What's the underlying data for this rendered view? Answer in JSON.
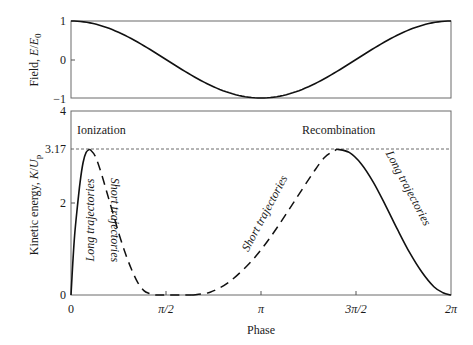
{
  "chart_data": [
    {
      "type": "line",
      "panel": "top",
      "title": "",
      "xlabel": "",
      "ylabel": "Field, E/E0",
      "ylabel_parts": {
        "main": "Field, ",
        "sym": "E",
        "slash": "/",
        "sym2": "E",
        "sub": "0"
      },
      "ylim": [
        -1,
        1
      ],
      "xlim": [
        0,
        6.283
      ],
      "yticks": [
        1,
        0,
        -1
      ],
      "ytick_labels": [
        "1",
        "0",
        "−1"
      ],
      "grid": false,
      "series": [
        {
          "name": "Field cos(phase)",
          "style": "solid",
          "function": "cos",
          "x": [
            0,
            0.785,
            1.571,
            2.356,
            3.142,
            3.927,
            4.712,
            5.498,
            6.283
          ],
          "y": [
            1,
            0.707,
            0,
            -0.707,
            -1,
            -0.707,
            0,
            0.707,
            1
          ]
        }
      ]
    },
    {
      "type": "line",
      "panel": "bottom",
      "title": "",
      "xlabel": "Phase",
      "ylabel": "Kinetic energy, K/Up",
      "ylabel_parts": {
        "main": "Kinetic energy, ",
        "sym": "K",
        "slash": "/",
        "sym2": "U",
        "sub": "p"
      },
      "ylim": [
        0,
        4
      ],
      "xlim": [
        0,
        6.283
      ],
      "yticks": [
        0,
        2,
        3.17,
        4
      ],
      "ytick_labels": [
        "0",
        "2",
        "3.17",
        "4"
      ],
      "xticks": [
        0,
        1.571,
        3.142,
        4.712,
        6.283
      ],
      "xtick_labels": [
        "0",
        "π/2",
        "π",
        "3π/2",
        "2π"
      ],
      "grid": false,
      "reference_line": {
        "y": 3.17,
        "style": "dotted"
      },
      "annotations": [
        {
          "text": "Ionization",
          "x": 0.05,
          "y": 3.62
        },
        {
          "text": "Recombination",
          "x": 3.75,
          "y": 3.62
        },
        {
          "text": "Long trajectories",
          "rotation": -90,
          "x": 0.22,
          "y": 1.6
        },
        {
          "text": "Short trajectories",
          "rotation": 90,
          "x": 0.78,
          "y": 1.6
        },
        {
          "text": "Short trajectories",
          "rotation": -60,
          "x": 3.32,
          "y": 1.9
        },
        {
          "text": "Long trajectories",
          "rotation": 60,
          "x": 5.45,
          "y": 2.1
        }
      ],
      "series": [
        {
          "name": "Long trajectories (ionization)",
          "style": "solid",
          "x": [
            0,
            0.03,
            0.06,
            0.1,
            0.15,
            0.2,
            0.25,
            0.31
          ],
          "y": [
            0,
            0.7,
            1.3,
            1.85,
            2.45,
            2.88,
            3.1,
            3.17
          ]
        },
        {
          "name": "Short trajectories (ionization)",
          "style": "dashed",
          "x": [
            0.31,
            0.4,
            0.5,
            0.6,
            0.7,
            0.8,
            0.9,
            1.0,
            1.1,
            1.2,
            1.3,
            1.4,
            1.57,
            1.8,
            2.0
          ],
          "y": [
            3.17,
            3.02,
            2.65,
            2.2,
            1.75,
            1.3,
            0.9,
            0.56,
            0.28,
            0.1,
            0.03,
            0.0,
            0.0,
            0.0,
            0.0
          ]
        },
        {
          "name": "Short trajectories (recombination)",
          "style": "dashed",
          "x": [
            2.0,
            2.3,
            2.6,
            2.9,
            3.14,
            3.4,
            3.7,
            4.0,
            4.2,
            4.4
          ],
          "y": [
            0.0,
            0.06,
            0.27,
            0.62,
            0.98,
            1.45,
            2.05,
            2.65,
            3.0,
            3.17
          ]
        },
        {
          "name": "Long trajectories (recombination)",
          "style": "solid",
          "x": [
            4.4,
            4.6,
            4.8,
            5.0,
            5.2,
            5.4,
            5.6,
            5.8,
            6.0,
            6.15,
            6.283
          ],
          "y": [
            3.17,
            3.1,
            2.85,
            2.45,
            1.95,
            1.42,
            0.92,
            0.5,
            0.18,
            0.05,
            0.0
          ]
        }
      ]
    }
  ],
  "labels": {
    "top_ylabel_main": "Field, ",
    "top_ylabel_E": "E",
    "top_ylabel_slash": "/",
    "top_ylabel_E0": "E",
    "top_ylabel_sub": "0",
    "bottom_ylabel_main": "Kinetic energy, ",
    "bottom_ylabel_K": "K",
    "bottom_ylabel_slash": "/",
    "bottom_ylabel_U": "U",
    "bottom_ylabel_sub": "p",
    "xlabel": "Phase",
    "ionization": "Ionization",
    "recombination": "Recombination",
    "long_left": "Long trajectories",
    "short_left": "Short trajectories",
    "short_right": "Short trajectories",
    "long_right": "Long trajectories",
    "top_ticks": [
      "1",
      "0",
      "−1"
    ],
    "bottom_ticks": [
      "4",
      "3.17",
      "2",
      "0"
    ],
    "x_ticks": [
      "0",
      "π/2",
      "π",
      "3π/2",
      "2π"
    ]
  },
  "colors": {
    "axis": "#555555",
    "curve": "#111111",
    "text": "#1a1a1a"
  }
}
